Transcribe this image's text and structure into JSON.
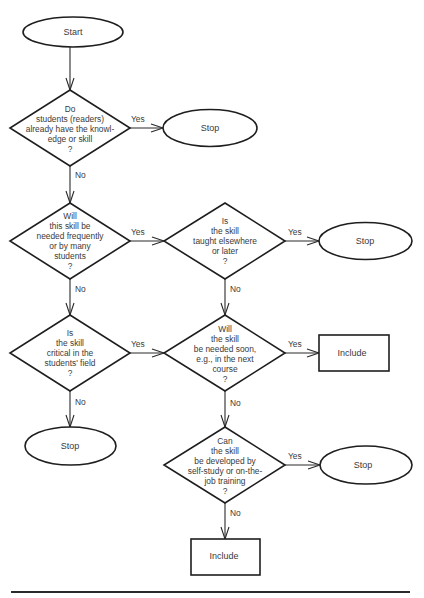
{
  "flowchart": {
    "nodes": [
      {
        "id": "start",
        "type": "terminal",
        "text": "Start"
      },
      {
        "id": "q1",
        "type": "decision",
        "text": "Do\nstudents (readers)\nalready have the knowl-\nedge or skill\n?"
      },
      {
        "id": "stop1",
        "type": "terminal",
        "text": "Stop"
      },
      {
        "id": "q2",
        "type": "decision",
        "text": "Will\nthis skill be\nneeded frequently\nor by many\nstudents\n?"
      },
      {
        "id": "q3",
        "type": "decision",
        "text": "Is\nthe skill\ntaught elsewhere\nor later\n?"
      },
      {
        "id": "stop2",
        "type": "terminal",
        "text": "Stop"
      },
      {
        "id": "q4",
        "type": "decision",
        "text": "Is\nthe skill\ncritical in the\nstudents' field\n?"
      },
      {
        "id": "q5",
        "type": "decision",
        "text": "Will\nthe skill\nbe needed soon,\ne.g., in the next\ncourse\n?"
      },
      {
        "id": "include1",
        "type": "process",
        "text": "Include"
      },
      {
        "id": "stop3",
        "type": "terminal",
        "text": "Stop"
      },
      {
        "id": "q6",
        "type": "decision",
        "text": "Can\nthe skill\nbe developed by\nself-study or on-the-\njob training\n?"
      },
      {
        "id": "stop4",
        "type": "terminal",
        "text": "Stop"
      },
      {
        "id": "include2",
        "type": "process",
        "text": "Include"
      }
    ],
    "edges": [
      {
        "from": "start",
        "to": "q1",
        "label": ""
      },
      {
        "from": "q1",
        "to": "stop1",
        "label": "Yes"
      },
      {
        "from": "q1",
        "to": "q2",
        "label": "No"
      },
      {
        "from": "q2",
        "to": "q3",
        "label": "Yes"
      },
      {
        "from": "q2",
        "to": "q4",
        "label": "No"
      },
      {
        "from": "q3",
        "to": "stop2",
        "label": "Yes"
      },
      {
        "from": "q3",
        "to": "q5",
        "label": "No"
      },
      {
        "from": "q4",
        "to": "q5",
        "label": "Yes"
      },
      {
        "from": "q4",
        "to": "stop3",
        "label": "No"
      },
      {
        "from": "q5",
        "to": "include1",
        "label": "Yes"
      },
      {
        "from": "q5",
        "to": "q6",
        "label": "No"
      },
      {
        "from": "q6",
        "to": "stop4",
        "label": "Yes"
      },
      {
        "from": "q6",
        "to": "include2",
        "label": "No"
      }
    ]
  },
  "labels": {
    "start": "Start",
    "q1": "Do\nstudents (readers)\nalready have the knowl-\nedge or skill\n?",
    "stop1": "Stop",
    "q2": "Will\nthis skill be\nneeded frequently\nor by many\nstudents\n?",
    "q3": "Is\nthe skill\ntaught elsewhere\nor later\n?",
    "stop2": "Stop",
    "q4": "Is\nthe skill\ncritical in the\nstudents' field\n?",
    "q5": "Will\nthe skill\nbe needed soon,\ne.g., in the next\ncourse\n?",
    "include1": "Include",
    "stop3": "Stop",
    "q6": "Can\nthe skill\nbe developed by\nself-study or on-the-\njob training\n?",
    "stop4": "Stop",
    "include2": "Include"
  },
  "edge_labels": {
    "yes": "Yes",
    "no": "No"
  }
}
